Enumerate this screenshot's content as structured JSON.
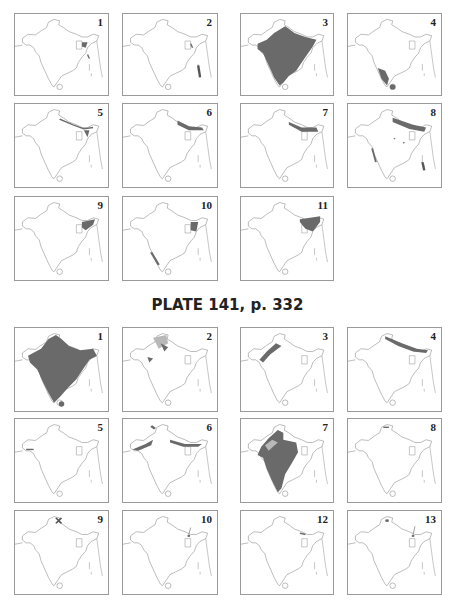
{
  "page": {
    "colors": {
      "outline": "#8a8a8a",
      "range": "#6a6a6a",
      "light_range": "#b8b8b8",
      "border": "#9a9a9a"
    }
  },
  "plate_top": {
    "maps": [
      {
        "label": "1",
        "range": "northeast-small"
      },
      {
        "label": "2",
        "range": "andaman-islands"
      },
      {
        "label": "3",
        "range": "most-peninsula"
      },
      {
        "label": "4",
        "range": "south-india-srilanka"
      },
      {
        "label": "5",
        "range": "himalaya-east"
      },
      {
        "label": "6",
        "range": "himalaya-east"
      },
      {
        "label": "7",
        "range": "himalaya-east"
      },
      {
        "label": "8",
        "range": "himalaya-scattered"
      },
      {
        "label": "9",
        "range": "northeast"
      },
      {
        "label": "10",
        "range": "northeast-westghats"
      },
      {
        "label": "11",
        "range": "northeast-large"
      }
    ]
  },
  "plate_bottom": {
    "title": "PLATE 141, p. 332",
    "maps": [
      {
        "label": "1",
        "range": "whole-subcontinent"
      },
      {
        "label": "2",
        "range": "northwest"
      },
      {
        "label": "3",
        "range": "indus-northwest"
      },
      {
        "label": "4",
        "range": "himalaya"
      },
      {
        "label": "5",
        "range": "small-west"
      },
      {
        "label": "6",
        "range": "himalaya-northwest"
      },
      {
        "label": "7",
        "range": "peninsula-west"
      },
      {
        "label": "8",
        "range": "kashmir-small"
      },
      {
        "label": "9",
        "range": "kashmir-point"
      },
      {
        "label": "10",
        "range": "nepal-point"
      },
      {
        "label": "12",
        "range": "nepal-point"
      },
      {
        "label": "13",
        "range": "kashmir-nepal-point"
      }
    ]
  }
}
